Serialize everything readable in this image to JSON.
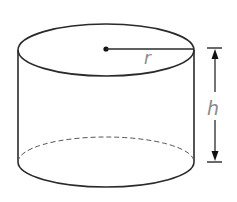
{
  "diagram": {
    "shape": "cylinder",
    "labels": {
      "radius": "r",
      "height": "h"
    },
    "colors": {
      "stroke": "#2a2a2a",
      "label": "#8a8a8a",
      "background": "#ffffff"
    }
  }
}
